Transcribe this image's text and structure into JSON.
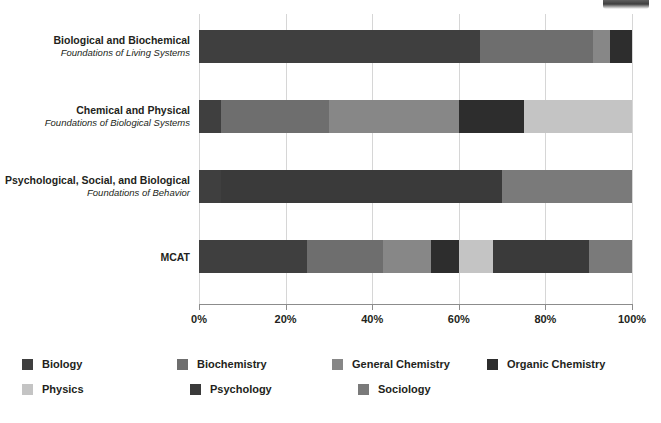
{
  "chart_data": {
    "type": "bar",
    "orientation": "horizontal",
    "stacked": true,
    "title": "",
    "xlabel": "",
    "ylabel": "",
    "xlim": [
      0,
      100
    ],
    "xunit": "%",
    "grid": true,
    "legend_position": "bottom",
    "xticks": [
      {
        "value": 0,
        "label": "0%"
      },
      {
        "value": 20,
        "label": "20%"
      },
      {
        "value": 40,
        "label": "40%"
      },
      {
        "value": 60,
        "label": "60%"
      },
      {
        "value": 80,
        "label": "80%"
      },
      {
        "value": 100,
        "label": "100%"
      }
    ],
    "categories": [
      {
        "line1": "Biological and Biochemical",
        "line2": "Foundations of Living Systems"
      },
      {
        "line1": "Chemical and Physical",
        "line2": "Foundations of Biological Systems"
      },
      {
        "line1": "Psychological, Social, and Biological",
        "line2": "Foundations of Behavior"
      },
      {
        "line1": "MCAT",
        "line2": ""
      }
    ],
    "series": [
      {
        "name": "Biology",
        "color": "#3f3f3f",
        "values": [
          65,
          5,
          5,
          25
        ]
      },
      {
        "name": "Biochemistry",
        "color": "#6e6e6e",
        "values": [
          25,
          0,
          0,
          17.5
        ]
      },
      {
        "name": "General Chemistry",
        "color": "#878787",
        "values": [
          5,
          25,
          0,
          11
        ]
      },
      {
        "name": "Organic Chemistry",
        "color": "#2d2d2d",
        "values": [
          5,
          0,
          0,
          6.5
        ]
      },
      {
        "name": "Physics",
        "color": "#c4c4c4",
        "values": [
          0,
          0,
          0,
          7.5
        ]
      },
      {
        "name": "Psychology",
        "color": "#3a3a3a",
        "values": [
          0,
          0,
          65,
          22
        ]
      },
      {
        "name": "Sociology",
        "color": "#7a7a7a",
        "values": [
          0,
          0,
          30,
          10
        ]
      }
    ],
    "bars": [
      {
        "category": "Biological and Biochemical",
        "segments": [
          {
            "series": "Biology",
            "start": 0,
            "end": 65,
            "value": 65,
            "color": "#3f3f3f"
          },
          {
            "series": "Biochemistry",
            "start": 65,
            "end": 91,
            "value": 26,
            "color": "#6e6e6e"
          },
          {
            "series": "General Chemistry",
            "start": 91,
            "end": 95,
            "value": 4,
            "color": "#878787"
          },
          {
            "series": "Organic Chemistry",
            "start": 95,
            "end": 100,
            "value": 5,
            "color": "#2d2d2d"
          }
        ]
      },
      {
        "category": "Chemical and Physical",
        "segments": [
          {
            "series": "Biology",
            "start": 0,
            "end": 5,
            "value": 5,
            "color": "#3f3f3f"
          },
          {
            "series": "Biochemistry",
            "start": 5,
            "end": 30,
            "value": 25,
            "color": "#6e6e6e"
          },
          {
            "series": "General Chemistry",
            "start": 30,
            "end": 60,
            "value": 30,
            "color": "#878787"
          },
          {
            "series": "Organic Chemistry",
            "start": 60,
            "end": 75,
            "value": 15,
            "color": "#2d2d2d"
          },
          {
            "series": "Physics",
            "start": 75,
            "end": 100,
            "value": 25,
            "color": "#c4c4c4"
          }
        ]
      },
      {
        "category": "Psychological, Social, and Biological",
        "segments": [
          {
            "series": "Biology",
            "start": 0,
            "end": 5,
            "value": 5,
            "color": "#3f3f3f"
          },
          {
            "series": "Psychology",
            "start": 5,
            "end": 70,
            "value": 65,
            "color": "#3a3a3a"
          },
          {
            "series": "Sociology",
            "start": 70,
            "end": 100,
            "value": 30,
            "color": "#7a7a7a"
          }
        ]
      },
      {
        "category": "MCAT",
        "segments": [
          {
            "series": "Biology",
            "start": 0,
            "end": 25,
            "value": 25,
            "color": "#3f3f3f"
          },
          {
            "series": "Biochemistry",
            "start": 25,
            "end": 42.5,
            "value": 17.5,
            "color": "#6e6e6e"
          },
          {
            "series": "General Chemistry",
            "start": 42.5,
            "end": 53.5,
            "value": 11,
            "color": "#878787"
          },
          {
            "series": "Organic Chemistry",
            "start": 53.5,
            "end": 60,
            "value": 6.5,
            "color": "#2d2d2d"
          },
          {
            "series": "Physics",
            "start": 60,
            "end": 68,
            "value": 8,
            "color": "#c4c4c4"
          },
          {
            "series": "Psychology",
            "start": 68,
            "end": 90,
            "value": 22,
            "color": "#3a3a3a"
          },
          {
            "series": "Sociology",
            "start": 90,
            "end": 100,
            "value": 10,
            "color": "#7a7a7a"
          }
        ]
      }
    ]
  },
  "legend": {
    "rows": [
      [
        {
          "label": "Biology",
          "color": "#3f3f3f",
          "swatch_name": "legend-swatch-biology"
        },
        {
          "label": "Biochemistry",
          "color": "#6e6e6e",
          "swatch_name": "legend-swatch-biochemistry"
        },
        {
          "label": "General Chemistry",
          "color": "#878787",
          "swatch_name": "legend-swatch-general-chemistry"
        },
        {
          "label": "Organic Chemistry",
          "color": "#2d2d2d",
          "swatch_name": "legend-swatch-organic-chemistry"
        }
      ],
      [
        {
          "label": "Physics",
          "color": "#c4c4c4",
          "swatch_name": "legend-swatch-physics"
        },
        {
          "label": "Psychology",
          "color": "#3a3a3a",
          "swatch_name": "legend-swatch-psychology"
        },
        {
          "label": "Sociology",
          "color": "#7a7a7a",
          "swatch_name": "legend-swatch-sociology"
        }
      ]
    ]
  }
}
